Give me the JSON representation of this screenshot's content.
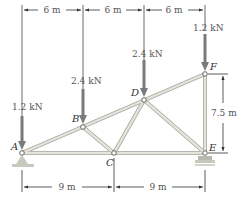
{
  "diagram": {
    "type": "truss",
    "nodes": [
      {
        "id": "A",
        "label": "A",
        "x": 22,
        "y": 153
      },
      {
        "id": "B",
        "label": "B",
        "x": 83,
        "y": 127
      },
      {
        "id": "C",
        "label": "C",
        "x": 114,
        "y": 153
      },
      {
        "id": "D",
        "label": "D",
        "x": 144,
        "y": 100
      },
      {
        "id": "E",
        "label": "E",
        "x": 205,
        "y": 153
      },
      {
        "id": "F",
        "label": "F",
        "x": 205,
        "y": 74
      }
    ],
    "members": [
      [
        "A",
        "B"
      ],
      [
        "B",
        "D"
      ],
      [
        "D",
        "F"
      ],
      [
        "A",
        "C"
      ],
      [
        "C",
        "E"
      ],
      [
        "B",
        "C"
      ],
      [
        "C",
        "D"
      ],
      [
        "D",
        "E"
      ],
      [
        "E",
        "F"
      ]
    ],
    "loads": [
      {
        "node": "A",
        "label": "1.2 kN"
      },
      {
        "node": "B",
        "label": "2.4 kN"
      },
      {
        "node": "D",
        "label": "2.4 kN"
      },
      {
        "node": "F",
        "label": "1.2 kN"
      }
    ],
    "dimensions": {
      "top": [
        "6 m",
        "6 m",
        "6 m"
      ],
      "bottom": [
        "9 m",
        "9 m"
      ],
      "height": "7.5 m"
    },
    "supports": [
      {
        "node": "A",
        "type": "pin"
      },
      {
        "node": "E",
        "type": "roller"
      }
    ],
    "colors": {
      "member": "#d8d8d0",
      "member_edge": "#a9a9a0",
      "load_arrow": "#7a7a7a",
      "dimension": "#333333"
    }
  }
}
